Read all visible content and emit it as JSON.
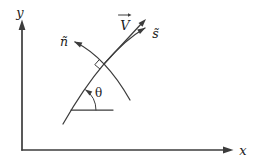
{
  "colors": {
    "background": "#ffffff",
    "line": "#3c3c3c",
    "text": "#1c1c1c"
  },
  "labels": {
    "y_axis": "y",
    "x_axis": "x",
    "velocity_vector": "V",
    "tangent_vector": "s̃",
    "normal_vector": "ñ",
    "angle": "θ"
  }
}
